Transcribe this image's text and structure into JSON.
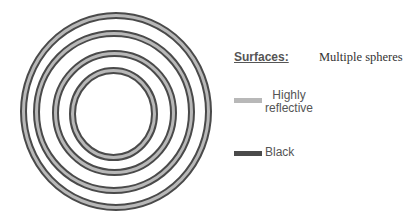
{
  "diagram": {
    "subtitle": "Multiple spheres",
    "legend": {
      "title": "Surfaces:",
      "items": [
        {
          "label_line1": "Highly",
          "label_line2": "reflective",
          "color": "#b8b8b8"
        },
        {
          "label": "Black",
          "color": "#4a4a4a"
        }
      ]
    },
    "rings": [
      {
        "cx": 116,
        "cy": 111.5,
        "rx": 92.5,
        "ry": 96
      },
      {
        "cx": 114,
        "cy": 112,
        "rx": 77.5,
        "ry": 78.5
      },
      {
        "cx": 114.5,
        "cy": 113,
        "rx": 59,
        "ry": 59.5
      },
      {
        "cx": 113.5,
        "cy": 114,
        "rx": 41,
        "ry": 43.5
      }
    ],
    "colors": {
      "dark_edge": "#4a4a4a",
      "reflective_band": "#b8b8b8"
    }
  }
}
